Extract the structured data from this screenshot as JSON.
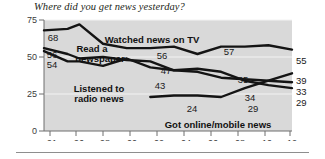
{
  "title": "Where did you get news yesterday?",
  "colors": {
    "plot_background": "#d9d9d9",
    "line": "#1a1a1a",
    "axis": "#6f6f6f",
    "gridline": "#f2f2f2",
    "text": "#231f20"
  },
  "axes": {
    "y_ticks": [
      "0",
      "25",
      "50",
      "75"
    ],
    "y_tick_values": [
      0,
      25,
      50,
      75
    ],
    "ylim": [
      0,
      75
    ],
    "x_ticks": [
      "91",
      "96",
      "98",
      "00",
      "02",
      "04",
      "06",
      "08",
      "10",
      "12"
    ],
    "x_tick_values": [
      1991,
      1996,
      1998,
      2000,
      2002,
      2004,
      2006,
      2008,
      2010,
      2012
    ]
  },
  "series_labels": [
    {
      "name": "tv-label",
      "text": "Watched news on TV",
      "x": 152,
      "y": 27
    },
    {
      "name": "newspaper-label",
      "text": "Read a",
      "x": 92,
      "y": 36
    },
    {
      "name": "newspaper-label-2",
      "text": "newspaper",
      "x": 100,
      "y": 46
    },
    {
      "name": "radio-label",
      "text": "Listened to",
      "x": 99,
      "y": 76
    },
    {
      "name": "radio-label-2",
      "text": "radio news",
      "x": 99,
      "y": 86
    },
    {
      "name": "online-label",
      "text": "Got online/mobile news",
      "x": 218,
      "y": 112
    }
  ],
  "point_labels": [
    {
      "text": "68",
      "x": 53,
      "y": 25
    },
    {
      "text": "56",
      "x": 52,
      "y": 42
    },
    {
      "text": "54",
      "x": 52,
      "y": 52
    },
    {
      "text": "56",
      "x": 162,
      "y": 43
    },
    {
      "text": "47",
      "x": 166,
      "y": 58
    },
    {
      "text": "43",
      "x": 160,
      "y": 73
    },
    {
      "text": "57",
      "x": 229,
      "y": 39
    },
    {
      "text": "35",
      "x": 243,
      "y": 67
    },
    {
      "text": "34",
      "x": 250,
      "y": 85
    },
    {
      "text": "24",
      "x": 192,
      "y": 96
    },
    {
      "text": "29",
      "x": 253,
      "y": 96
    }
  ],
  "end_labels": [
    {
      "text": "55",
      "x": 296,
      "y": 48
    },
    {
      "text": "39",
      "x": 296,
      "y": 68
    },
    {
      "text": "33",
      "x": 296,
      "y": 79
    },
    {
      "text": "29",
      "x": 296,
      "y": 90
    }
  ],
  "chart_data": {
    "type": "line",
    "title": "Where did you get news yesterday?",
    "xlabel": "",
    "ylabel": "",
    "ylim": [
      0,
      75
    ],
    "grid": true,
    "legend": "annotations-on-lines",
    "x": [
      1991,
      1993,
      1994,
      1996,
      1998,
      2000,
      2002,
      2004,
      2006,
      2008,
      2010,
      2012
    ],
    "series": [
      {
        "name": "Watched news on TV",
        "values": [
          68,
          69,
          72,
          59,
          56,
          56,
          57,
          52,
          57,
          57,
          58,
          55
        ],
        "labeled_points": [
          {
            "x": 1991,
            "value": 68
          },
          {
            "x": 1998,
            "value": 56
          },
          {
            "x": 2006,
            "value": 57
          },
          {
            "x": 2012,
            "value": 55
          }
        ]
      },
      {
        "name": "Read a newspaper",
        "values": [
          56,
          52,
          49,
          50,
          48,
          47,
          41,
          42,
          40,
          34,
          31,
          29
        ],
        "labeled_points": [
          {
            "x": 1991,
            "value": 56
          },
          {
            "x": 2000,
            "value": 47
          },
          {
            "x": 2008,
            "value": 34
          },
          {
            "x": 2012,
            "value": 29
          }
        ]
      },
      {
        "name": "Listened to radio news",
        "values": [
          54,
          47,
          47,
          44,
          49,
          43,
          41,
          40,
          36,
          35,
          34,
          33
        ],
        "labeled_points": [
          {
            "x": 1991,
            "value": 54
          },
          {
            "x": 2000,
            "value": 43
          },
          {
            "x": 2008,
            "value": 35
          },
          {
            "x": 2012,
            "value": 33
          }
        ]
      },
      {
        "name": "Got online/mobile news",
        "values": [
          null,
          null,
          null,
          null,
          null,
          23,
          24,
          24,
          23,
          29,
          34,
          39
        ],
        "labeled_points": [
          {
            "x": 2002,
            "value": 24
          },
          {
            "x": 2008,
            "value": 29
          },
          {
            "x": 2012,
            "value": 39
          }
        ]
      }
    ]
  }
}
